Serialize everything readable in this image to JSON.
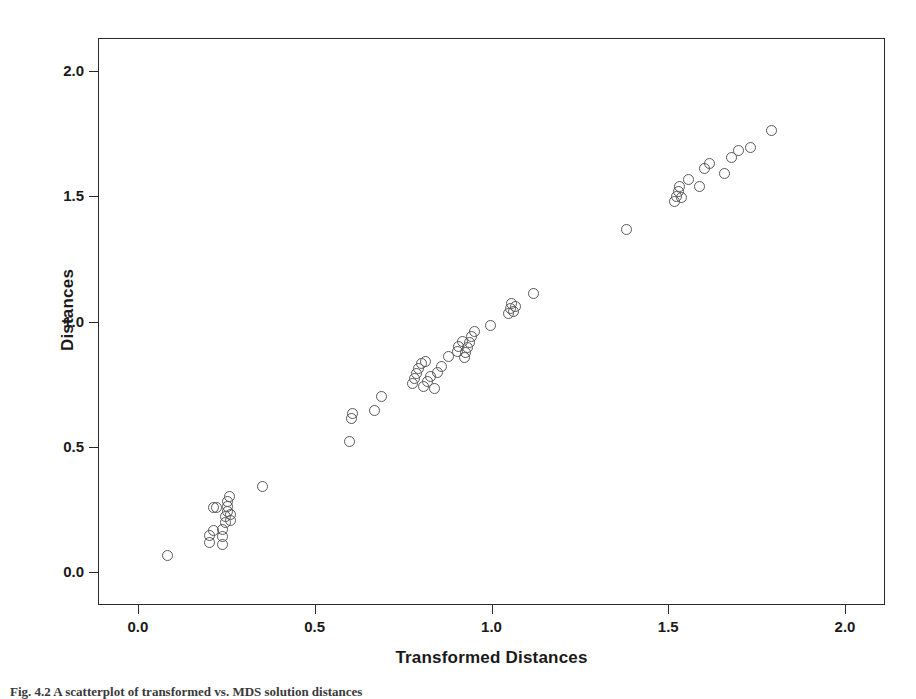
{
  "figure": {
    "caption": "Fig. 4.2  A scatterplot of transformed vs. MDS solution distances"
  },
  "chart_data": {
    "type": "scatter",
    "title": "",
    "xlabel": "Transformed Distances",
    "ylabel": "Distances",
    "xlim": [
      -0.113,
      2.113
    ],
    "ylim": [
      -0.132,
      2.132
    ],
    "xticks": [
      "0.0",
      "0.5",
      "1.0",
      "1.5",
      "2.0"
    ],
    "xtick_values": [
      0.0,
      0.5,
      1.0,
      1.5,
      2.0
    ],
    "yticks": [
      "0.0",
      "0.5",
      "1.0",
      "1.5",
      "2.0"
    ],
    "ytick_values": [
      0.0,
      0.5,
      1.0,
      1.5,
      2.0
    ],
    "grid": false,
    "legend": false,
    "marker": "open-circle",
    "marker_color": "#595959",
    "marker_size": 11,
    "n_points": 66,
    "points": [
      [
        0.08,
        0.07
      ],
      [
        0.2,
        0.12
      ],
      [
        0.2,
        0.15
      ],
      [
        0.21,
        0.17
      ],
      [
        0.21,
        0.26
      ],
      [
        0.22,
        0.26
      ],
      [
        0.235,
        0.115
      ],
      [
        0.235,
        0.145
      ],
      [
        0.235,
        0.175
      ],
      [
        0.245,
        0.2
      ],
      [
        0.245,
        0.225
      ],
      [
        0.25,
        0.245
      ],
      [
        0.25,
        0.265
      ],
      [
        0.25,
        0.285
      ],
      [
        0.255,
        0.305
      ],
      [
        0.26,
        0.21
      ],
      [
        0.26,
        0.235
      ],
      [
        0.35,
        0.345
      ],
      [
        0.595,
        0.525
      ],
      [
        0.6,
        0.615
      ],
      [
        0.605,
        0.635
      ],
      [
        0.665,
        0.65
      ],
      [
        0.685,
        0.705
      ],
      [
        0.775,
        0.755
      ],
      [
        0.78,
        0.775
      ],
      [
        0.785,
        0.795
      ],
      [
        0.79,
        0.815
      ],
      [
        0.8,
        0.835
      ],
      [
        0.81,
        0.845
      ],
      [
        0.805,
        0.745
      ],
      [
        0.815,
        0.765
      ],
      [
        0.825,
        0.785
      ],
      [
        0.835,
        0.735
      ],
      [
        0.845,
        0.8
      ],
      [
        0.855,
        0.825
      ],
      [
        0.875,
        0.865
      ],
      [
        0.9,
        0.885
      ],
      [
        0.905,
        0.905
      ],
      [
        0.915,
        0.925
      ],
      [
        0.92,
        0.86
      ],
      [
        0.925,
        0.88
      ],
      [
        0.93,
        0.9
      ],
      [
        0.935,
        0.92
      ],
      [
        0.94,
        0.945
      ],
      [
        0.95,
        0.965
      ],
      [
        0.995,
        0.99
      ],
      [
        1.045,
        1.035
      ],
      [
        1.05,
        1.055
      ],
      [
        1.055,
        1.075
      ],
      [
        1.06,
        1.045
      ],
      [
        1.065,
        1.065
      ],
      [
        1.115,
        1.115
      ],
      [
        1.38,
        1.37
      ],
      [
        1.515,
        1.485
      ],
      [
        1.52,
        1.505
      ],
      [
        1.525,
        1.525
      ],
      [
        1.53,
        1.545
      ],
      [
        1.535,
        1.5
      ],
      [
        1.555,
        1.57
      ],
      [
        1.585,
        1.545
      ],
      [
        1.6,
        1.615
      ],
      [
        1.615,
        1.635
      ],
      [
        1.655,
        1.595
      ],
      [
        1.675,
        1.66
      ],
      [
        1.695,
        1.685
      ],
      [
        1.73,
        1.7
      ],
      [
        1.79,
        1.765
      ]
    ]
  }
}
